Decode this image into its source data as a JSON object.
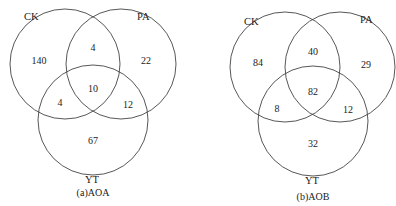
{
  "diagrams": [
    {
      "caption": "(a)AOA",
      "sets": {
        "a": "CK",
        "b": "PA",
        "c": "YT"
      },
      "regions": {
        "ck_only": "140",
        "pa_only": "22",
        "yt_only": "67",
        "ck_pa": "4",
        "ck_yt": "4",
        "pa_yt": "12",
        "all": "10"
      }
    },
    {
      "caption": "(b)AOB",
      "sets": {
        "a": "CK",
        "b": "PA",
        "c": "YT"
      },
      "regions": {
        "ck_only": "84",
        "pa_only": "29",
        "yt_only": "32",
        "ck_pa": "40",
        "ck_yt": "8",
        "pa_yt": "12",
        "all": "82"
      }
    }
  ]
}
